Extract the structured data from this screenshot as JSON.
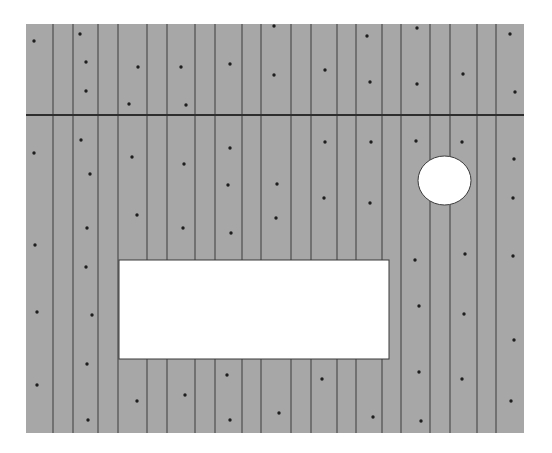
{
  "diagram": {
    "type": "wall-panel-elevation",
    "canvas": {
      "width": 552,
      "height": 453,
      "background": "#ffffff"
    },
    "panel": {
      "x": 26,
      "y": 24,
      "width": 498,
      "height": 409,
      "fill": "#a7a7a7",
      "board_line_color": "#4d4d4d",
      "board_line_width": 1.2
    },
    "board_lines_x": [
      53,
      73,
      98,
      118,
      147,
      167,
      195,
      215,
      242,
      261,
      291,
      311,
      337,
      356,
      382,
      401,
      430,
      450,
      477,
      496
    ],
    "seam": {
      "y": 115,
      "color": "#2e2e2e",
      "width": 2
    },
    "openings": {
      "rectangle": {
        "x": 119,
        "y": 260,
        "width": 270,
        "height": 99,
        "fill": "#ffffff",
        "stroke": "#3a3a3a"
      },
      "circle": {
        "cx": 444.5,
        "cy": 180.5,
        "rx": 26.5,
        "ry": 24.5,
        "fill": "#ffffff",
        "stroke": "#3a3a3a"
      }
    },
    "fasteners": {
      "color": "#1e1e1e",
      "radius": 1.7,
      "points": [
        [
          34,
          41
        ],
        [
          80,
          34
        ],
        [
          86,
          62
        ],
        [
          86,
          91
        ],
        [
          138,
          67
        ],
        [
          129,
          104
        ],
        [
          181,
          67
        ],
        [
          186,
          105
        ],
        [
          230,
          64
        ],
        [
          274,
          26
        ],
        [
          274,
          75
        ],
        [
          325,
          70
        ],
        [
          367,
          36
        ],
        [
          370,
          82
        ],
        [
          417,
          28
        ],
        [
          417,
          84
        ],
        [
          463,
          74
        ],
        [
          510,
          34
        ],
        [
          515,
          92
        ],
        [
          34,
          153
        ],
        [
          81,
          140
        ],
        [
          90,
          174
        ],
        [
          132,
          157
        ],
        [
          137,
          215
        ],
        [
          87,
          228
        ],
        [
          184,
          164
        ],
        [
          183,
          228
        ],
        [
          35,
          245
        ],
        [
          230,
          148
        ],
        [
          228,
          185
        ],
        [
          231,
          233
        ],
        [
          277,
          184
        ],
        [
          276,
          218
        ],
        [
          325,
          142
        ],
        [
          324,
          198
        ],
        [
          370,
          203
        ],
        [
          371,
          142
        ],
        [
          416,
          141
        ],
        [
          462,
          142
        ],
        [
          514,
          159
        ],
        [
          513,
          198
        ],
        [
          415,
          260
        ],
        [
          419,
          306
        ],
        [
          419,
          372
        ],
        [
          421,
          421
        ],
        [
          465,
          254
        ],
        [
          464,
          314
        ],
        [
          462,
          379
        ],
        [
          513,
          256
        ],
        [
          514,
          340
        ],
        [
          511,
          401
        ],
        [
          86,
          267
        ],
        [
          37,
          312
        ],
        [
          92,
          315
        ],
        [
          87,
          364
        ],
        [
          37,
          385
        ],
        [
          88,
          420
        ],
        [
          137,
          401
        ],
        [
          185,
          395
        ],
        [
          227,
          375
        ],
        [
          230,
          420
        ],
        [
          279,
          413
        ],
        [
          322,
          379
        ],
        [
          373,
          417
        ]
      ]
    }
  }
}
